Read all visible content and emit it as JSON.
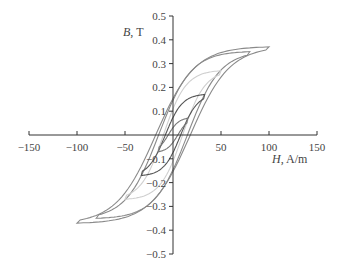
{
  "chart_data": {
    "type": "line",
    "title": "",
    "xlabel": "H, A/m",
    "ylabel": "B, T",
    "xlabel_italic": "H",
    "xlabel_unit": "A/m",
    "ylabel_italic": "B",
    "ylabel_unit": "T",
    "xlim": [
      -150,
      150
    ],
    "ylim": [
      -0.5,
      0.5
    ],
    "x_ticks": [
      -150,
      -100,
      -50,
      0,
      50,
      100,
      150
    ],
    "x_tick_labels": [
      "−150",
      "−100",
      "−50",
      "",
      "50",
      "100",
      "150"
    ],
    "y_ticks": [
      0.5,
      0.4,
      0.3,
      0.2,
      0.1,
      0,
      -0.1,
      -0.2,
      -0.3,
      -0.4,
      -0.5
    ],
    "y_tick_labels": [
      "0.5",
      "0.4",
      "0.3",
      "0.2",
      "0.1",
      "",
      "−0.1",
      "−0.2",
      "−0.3",
      "−0.4",
      "−0.5"
    ],
    "grid": false,
    "legend": "none",
    "series": [
      {
        "name": "Loop Hmax=100",
        "Hmax": 100,
        "Bmax": 0.37,
        "Hc": 18,
        "color": "#8a8a8a"
      },
      {
        "name": "Loop Hmax=80",
        "Hmax": 80,
        "Bmax": 0.35,
        "Hc": 15,
        "color": "#8a8a8a"
      },
      {
        "name": "Loop Hmax=50",
        "Hmax": 50,
        "Bmax": 0.27,
        "Hc": 10,
        "color": "#cfcfcf"
      },
      {
        "name": "Loop Hmax=33",
        "Hmax": 33,
        "Bmax": 0.17,
        "Hc": 8,
        "color": "#555555"
      },
      {
        "name": "Loop Hmax=15",
        "Hmax": 15,
        "Bmax": 0.07,
        "Hc": 5,
        "color": "#777777"
      }
    ]
  }
}
